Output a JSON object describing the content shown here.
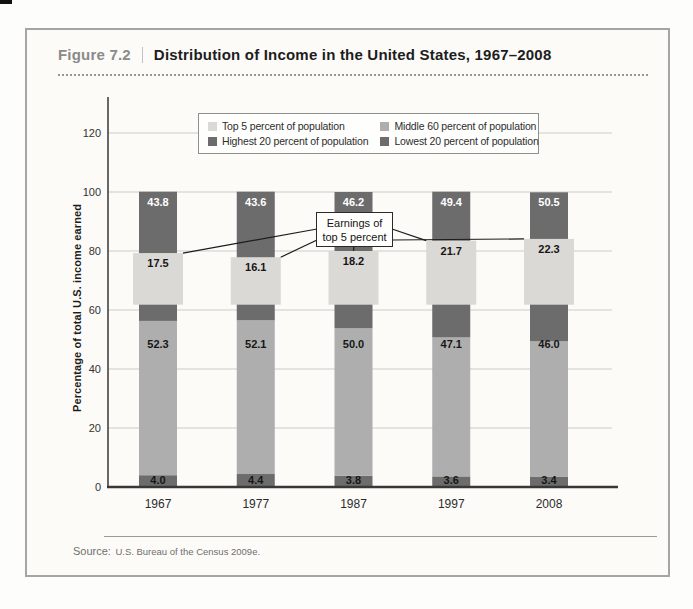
{
  "figure": {
    "label": "Figure 7.2",
    "title": "Distribution of Income in the United States, 1967–2008",
    "source_label": "Source:",
    "source_text": "U.S. Bureau of the Census 2009e."
  },
  "legend": {
    "items": [
      {
        "key": "top5",
        "label": "Top 5 percent of population"
      },
      {
        "key": "middle60",
        "label": "Middle 60 percent of population"
      },
      {
        "key": "highest20",
        "label": "Highest 20 percent of population"
      },
      {
        "key": "lowest20",
        "label": "Lowest 20 percent of population"
      }
    ]
  },
  "annotation": {
    "line1": "Earnings of",
    "line2": "top 5 percent"
  },
  "colors": {
    "top5": "#dad9d5",
    "middle60": "#aeaeae",
    "highest20": "#6c6c6c",
    "lowest20": "#6c6c6c",
    "gridline": "#cbcbc8",
    "axis": "#434341",
    "value_label_dark": "#161616",
    "value_label_light": "#ffffff"
  },
  "chart_data": {
    "type": "bar",
    "stacked": true,
    "unit": "percent of total U.S. income",
    "categories": [
      "1967",
      "1977",
      "1987",
      "1997",
      "2008"
    ],
    "series": [
      {
        "key": "lowest20",
        "name": "Lowest 20 percent of population",
        "values": [
          4.0,
          4.4,
          3.8,
          3.6,
          3.4
        ]
      },
      {
        "key": "middle60",
        "name": "Middle 60 percent of population",
        "values": [
          52.3,
          52.1,
          50.0,
          47.1,
          46.0
        ]
      },
      {
        "key": "highest20",
        "name": "Highest 20 percent of population",
        "values": [
          43.8,
          43.6,
          46.2,
          49.4,
          50.5
        ]
      },
      {
        "key": "top5",
        "name": "Top 5 percent of population",
        "values": [
          17.5,
          16.1,
          18.2,
          21.7,
          22.3
        ]
      }
    ],
    "overlay_series_key": "top5",
    "annotation": "Earnings of top 5 percent",
    "ylabel": "Percentage of total U.S. income earned",
    "yticks": [
      0,
      20,
      40,
      60,
      80,
      100,
      120
    ],
    "ylim": [
      0,
      130
    ],
    "grid": true,
    "legend_position": "top"
  }
}
